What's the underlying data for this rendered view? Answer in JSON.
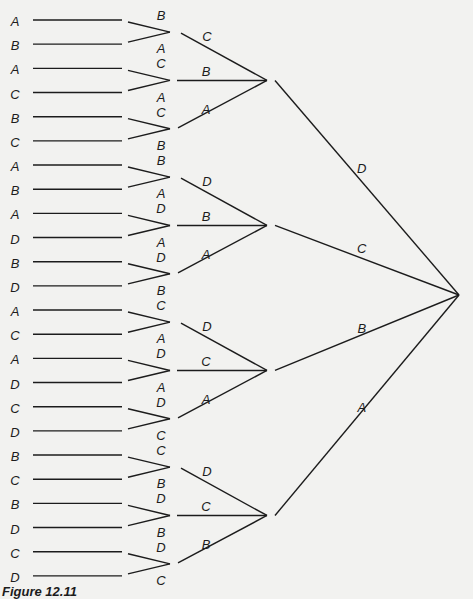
{
  "figure": {
    "caption": "Figure 12.11",
    "line_color": "#1c1c1c",
    "background": "#f2f2f0"
  },
  "leaves": [
    "A",
    "B",
    "A",
    "C",
    "B",
    "C",
    "A",
    "B",
    "A",
    "D",
    "B",
    "D",
    "A",
    "C",
    "A",
    "D",
    "C",
    "D",
    "B",
    "C",
    "B",
    "D",
    "C",
    "D"
  ],
  "pairs": [
    {
      "top": "B",
      "bottom": "A"
    },
    {
      "top": "C",
      "bottom": "A"
    },
    {
      "top": "C",
      "bottom": "B"
    },
    {
      "top": "B",
      "bottom": "A"
    },
    {
      "top": "D",
      "bottom": "A"
    },
    {
      "top": "D",
      "bottom": "B"
    },
    {
      "top": "C",
      "bottom": "A"
    },
    {
      "top": "D",
      "bottom": "A"
    },
    {
      "top": "D",
      "bottom": "C"
    },
    {
      "top": "C",
      "bottom": "B"
    },
    {
      "top": "D",
      "bottom": "B"
    },
    {
      "top": "D",
      "bottom": "C"
    }
  ],
  "triples": [
    {
      "labels": [
        "C",
        "B",
        "A"
      ]
    },
    {
      "labels": [
        "D",
        "B",
        "A"
      ]
    },
    {
      "labels": [
        "D",
        "C",
        "A"
      ]
    },
    {
      "labels": [
        "D",
        "C",
        "B"
      ]
    }
  ],
  "final_labels": [
    "D",
    "C",
    "B",
    "A"
  ]
}
